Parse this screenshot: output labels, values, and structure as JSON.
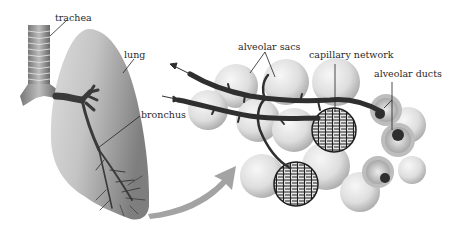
{
  "diagram": {
    "labels": {
      "trachea": "trachea",
      "lung": "lung",
      "bronchus": "bronchus",
      "alveolar_sacs": "alveolar sacs",
      "capillary_network": "capillary network",
      "alveolar_ducts": "alveolar ducts"
    },
    "colors": {
      "background": "#ffffff",
      "lung_light": "#e6e6e6",
      "lung_dark": "#8a8a8a",
      "airway": "#3a3a3a",
      "alveolus_light": "#f2f2f2",
      "alveolus_dark": "#b5b5b5",
      "arrow": "#9a9a9a",
      "leader_line": "#222222"
    }
  }
}
